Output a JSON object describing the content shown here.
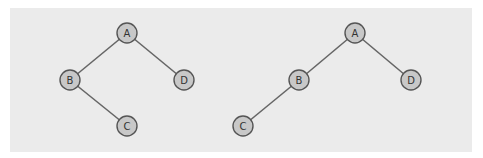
{
  "colors": {
    "panel": "#ebebeb",
    "node_fill": "#c8c8c8",
    "node_stroke": "#555555",
    "edge": "#666666"
  },
  "trees": [
    {
      "name": "left-tree",
      "nodes": [
        {
          "id": "A",
          "label": "A",
          "x": 127,
          "y": 33
        },
        {
          "id": "B",
          "label": "B",
          "x": 70,
          "y": 80
        },
        {
          "id": "D",
          "label": "D",
          "x": 184,
          "y": 80
        },
        {
          "id": "C",
          "label": "C",
          "x": 127,
          "y": 126
        }
      ],
      "edges": [
        [
          "A",
          "B"
        ],
        [
          "A",
          "D"
        ],
        [
          "B",
          "C"
        ]
      ]
    },
    {
      "name": "right-tree",
      "nodes": [
        {
          "id": "A",
          "label": "A",
          "x": 355,
          "y": 33
        },
        {
          "id": "B",
          "label": "B",
          "x": 299,
          "y": 80
        },
        {
          "id": "D",
          "label": "D",
          "x": 411,
          "y": 80
        },
        {
          "id": "C",
          "label": "C",
          "x": 243,
          "y": 126
        }
      ],
      "edges": [
        [
          "A",
          "B"
        ],
        [
          "A",
          "D"
        ],
        [
          "B",
          "C"
        ]
      ]
    }
  ]
}
